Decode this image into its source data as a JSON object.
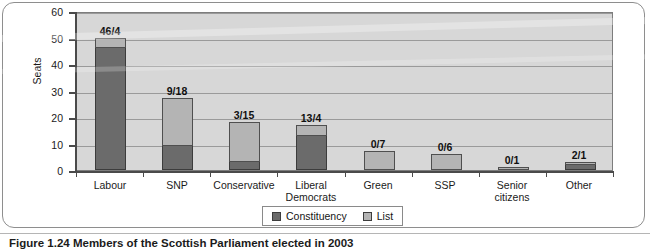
{
  "caption": "Figure 1.24 Members of the Scottish Parliament elected in 2003",
  "chart_data": {
    "type": "bar",
    "subtype": "stacked-bar",
    "title": "",
    "xlabel": "",
    "ylabel": "Seats",
    "ylim": [
      0,
      60
    ],
    "ytick_step": 10,
    "yticks": [
      "0",
      "10",
      "20",
      "30",
      "40",
      "50",
      "60"
    ],
    "grid": true,
    "legend_position": "bottom-center",
    "categories": [
      "Labour",
      "SNP",
      "Conservative",
      "Liberal Democrats",
      "Green",
      "SSP",
      "Senior citizens",
      "Other"
    ],
    "category_lines": [
      [
        "Labour"
      ],
      [
        "SNP"
      ],
      [
        "Conservative"
      ],
      [
        "Liberal",
        "Democrats"
      ],
      [
        "Green"
      ],
      [
        "SSP"
      ],
      [
        "Senior",
        "citizens"
      ],
      [
        "Other"
      ]
    ],
    "series": [
      {
        "name": "Constituency",
        "color": "#6b6b6b",
        "values": [
          46,
          9,
          3,
          13,
          0,
          0,
          0,
          2
        ]
      },
      {
        "name": "List",
        "color": "#b4b4b4",
        "values": [
          4,
          18,
          15,
          4,
          7,
          6,
          1,
          1
        ]
      }
    ],
    "bar_labels": [
      "46/4",
      "9/18",
      "3/15",
      "13/4",
      "0/7",
      "0/6",
      "0/1",
      "2/1"
    ],
    "totals": [
      50,
      27,
      18,
      17,
      7,
      6,
      1,
      3
    ]
  },
  "legend": {
    "items": [
      {
        "label": "Constituency",
        "color": "#6b6b6b"
      },
      {
        "label": "List",
        "color": "#b4b4b4"
      }
    ]
  },
  "colors": {
    "plot_background": "#d7d7d7",
    "gridline": "#9a9a9a",
    "axis": "#4a4a4a",
    "frame": "#8e8e8e",
    "constituency": "#6b6b6b",
    "list": "#b4b4b4"
  }
}
